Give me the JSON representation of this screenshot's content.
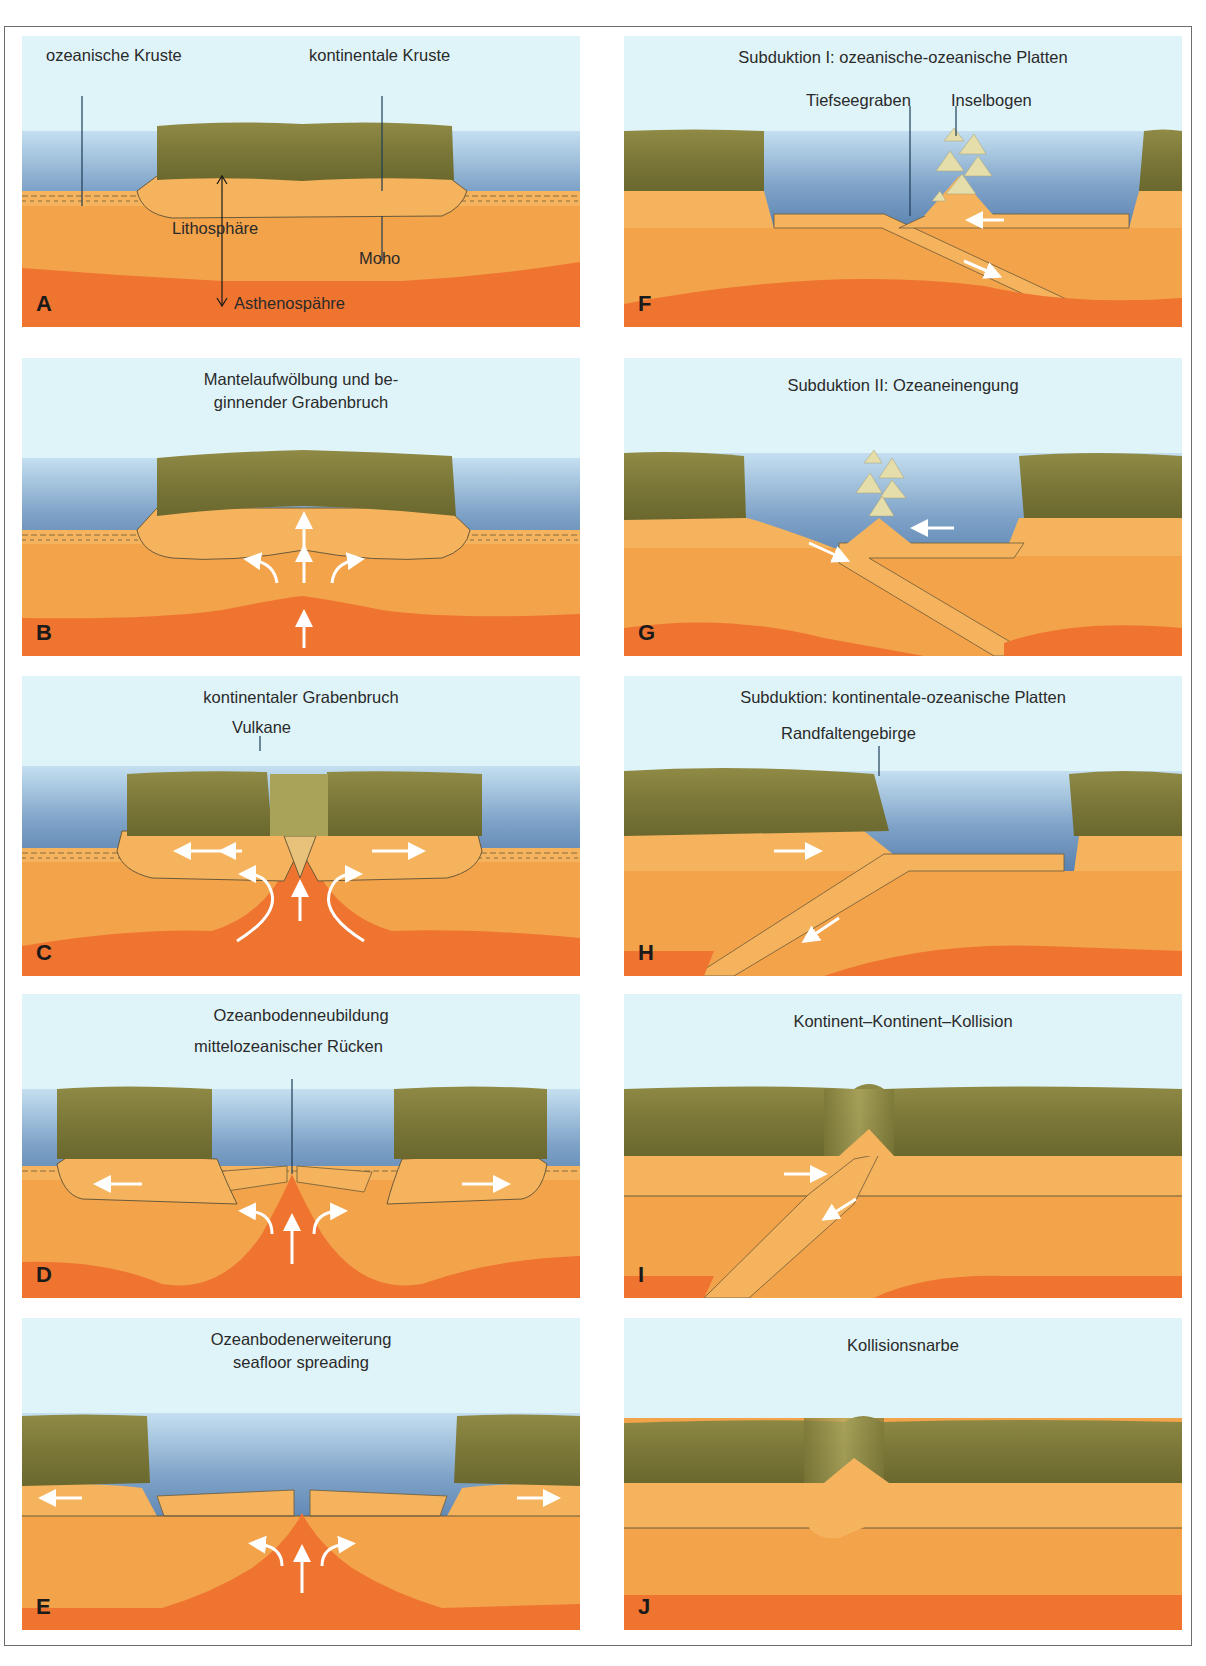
{
  "colors": {
    "sky": "#dff4f9",
    "water_top": "#a9c9e2",
    "water_bottom": "#5e86b3",
    "continent": "#7e7a3c",
    "continent_light": "#a9a35a",
    "crust_light": "#f5b35d",
    "lithosphere": "#f3a34a",
    "mantle": "#f29a3e",
    "asthenosphere": "#ef7430",
    "arrow": "#ffffff",
    "text": "#2a2a2a"
  },
  "panels": [
    {
      "id": "A",
      "letter": "A",
      "title": "",
      "labels": {
        "oceanic_crust": "ozeanische  Kruste",
        "continental_crust": "kontinentale Kruste",
        "lithosphere": "Lithosphäre",
        "moho": "Moho",
        "asthenosphere": "Asthenospähre"
      }
    },
    {
      "id": "B",
      "letter": "B",
      "title_lines": [
        "Mantelaufwölbung und be-",
        "ginnender Grabenbruch"
      ]
    },
    {
      "id": "C",
      "letter": "C",
      "title_lines": [
        "kontinentaler Grabenbruch"
      ],
      "labels": {
        "volcanoes": "Vulkane"
      }
    },
    {
      "id": "D",
      "letter": "D",
      "title_lines": [
        "Ozeanbodenneubildung"
      ],
      "labels": {
        "ridge": "mittelozeanischer Rücken"
      }
    },
    {
      "id": "E",
      "letter": "E",
      "title_lines": [
        "Ozeanbodenerweiterung",
        "seafloor spreading"
      ]
    },
    {
      "id": "F",
      "letter": "F",
      "title_lines": [
        "Subduktion I: ozeanische-ozeanische Platten"
      ],
      "labels": {
        "trench": "Tiefseegraben",
        "island_arc": "Inselbogen"
      }
    },
    {
      "id": "G",
      "letter": "G",
      "title_lines": [
        "Subduktion II: Ozeaneinengung"
      ]
    },
    {
      "id": "H",
      "letter": "H",
      "title_lines": [
        "Subduktion: kontinentale-ozeanische Platten"
      ],
      "labels": {
        "mountains": "Randfaltengebirge"
      }
    },
    {
      "id": "I",
      "letter": "I",
      "title_lines": [
        "Kontinent–Kontinent–Kollision"
      ]
    },
    {
      "id": "J",
      "letter": "J",
      "title_lines": [
        "Kollisionsnarbe"
      ]
    }
  ]
}
